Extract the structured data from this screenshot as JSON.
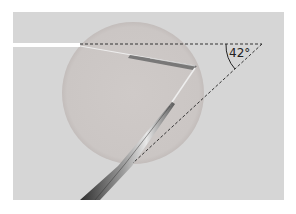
{
  "figure": {
    "angle_label": "42°",
    "colors": {
      "page_background": "#ffffff",
      "panel_background": "#d6d6d6",
      "droplet_fill": "#cdc8c6",
      "droplet_edge": "#c2bcba",
      "incident_beam": "#ffffff",
      "dashed_line": "#333333",
      "pipette": "#555555"
    },
    "elements": [
      "incident-light-beam",
      "horizontal-reference-line",
      "deviated-reference-line",
      "angle-arc",
      "droplet",
      "micropipette"
    ]
  }
}
